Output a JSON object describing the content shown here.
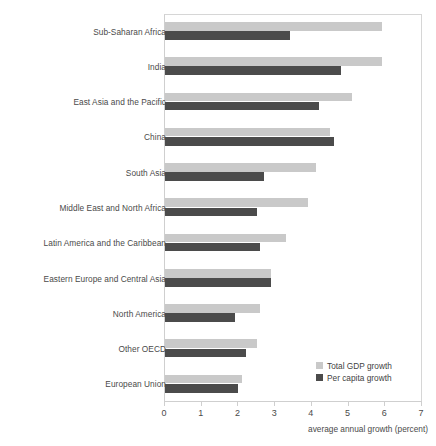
{
  "chart_data": {
    "type": "bar",
    "orientation": "horizontal",
    "title": "",
    "xlabel": "average annual growth (percent)",
    "ylabel": "",
    "xlim": [
      0,
      7
    ],
    "xticks": [
      0,
      1,
      2,
      3,
      4,
      5,
      6,
      7
    ],
    "xtick_labels": [
      "0",
      "1",
      "2",
      "3",
      "4",
      "5",
      "6",
      "7"
    ],
    "grid": false,
    "legend_position": "bottom-right",
    "categories": [
      "Sub-Saharan Africa",
      "India",
      "East Asia and the Pacific",
      "China",
      "South Asia",
      "Middle East and North Africa",
      "Latin America and the Caribbean",
      "Eastern Europe and Central Asia",
      "North America",
      "Other OECD",
      "European Union"
    ],
    "series": [
      {
        "name": "Total GDP growth",
        "color": "#c9c9c9",
        "values": [
          5.9,
          5.9,
          5.1,
          4.5,
          4.1,
          3.9,
          3.3,
          2.9,
          2.6,
          2.5,
          2.1
        ]
      },
      {
        "name": "Per capita growth",
        "color": "#4b4b4b",
        "values": [
          3.4,
          4.8,
          4.2,
          4.6,
          2.7,
          2.5,
          2.6,
          2.9,
          1.9,
          2.2,
          2.0
        ]
      }
    ]
  },
  "legend": {
    "items": [
      {
        "label": "Total GDP growth",
        "swatch": "total"
      },
      {
        "label": "Per capita growth",
        "swatch": "percap"
      }
    ]
  },
  "cropped_title": {
    "left_fragment": "",
    "right_fragment": ""
  }
}
